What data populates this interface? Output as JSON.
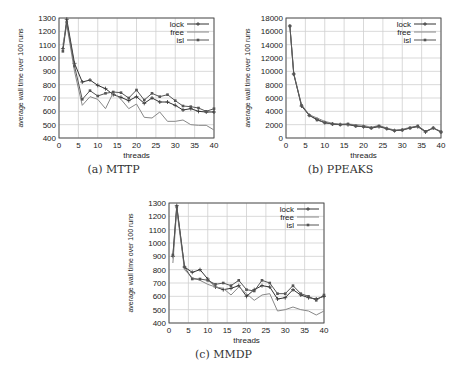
{
  "figure": {
    "captions": [
      "(a) MTTP",
      "(b) PPEAKS",
      "(c) MMDP"
    ]
  },
  "chart_data": [
    {
      "type": "line",
      "title": "(a) MTTP",
      "xlabel": "threads",
      "ylabel": "average wall time over 100 runs",
      "xlim": [
        0,
        40
      ],
      "ylim": [
        400,
        1300
      ],
      "xticks": [
        0,
        5,
        10,
        15,
        20,
        25,
        30,
        35,
        40
      ],
      "yticks": [
        400,
        500,
        600,
        700,
        800,
        900,
        1000,
        1100,
        1200,
        1300
      ],
      "grid": true,
      "legend_position": "top-right",
      "x": [
        1,
        2,
        4,
        6,
        8,
        10,
        12,
        14,
        16,
        18,
        20,
        22,
        24,
        26,
        28,
        30,
        32,
        34,
        36,
        38,
        40
      ],
      "series": [
        {
          "name": "lock",
          "marker": "plus",
          "color": "#333333",
          "values": [
            1070,
            1290,
            960,
            820,
            835,
            795,
            770,
            725,
            705,
            680,
            710,
            660,
            700,
            670,
            670,
            645,
            610,
            620,
            600,
            595,
            595
          ]
        },
        {
          "name": "free",
          "marker": "none",
          "color": "#888888",
          "values": [
            1100,
            1250,
            900,
            645,
            710,
            690,
            620,
            740,
            690,
            620,
            655,
            555,
            550,
            595,
            525,
            525,
            535,
            500,
            495,
            495,
            460
          ]
        },
        {
          "name": "isl",
          "marker": "square",
          "color": "#555555",
          "values": [
            1050,
            1270,
            940,
            690,
            755,
            715,
            735,
            745,
            740,
            700,
            760,
            685,
            735,
            710,
            725,
            680,
            640,
            635,
            625,
            600,
            620
          ]
        }
      ]
    },
    {
      "type": "line",
      "title": "(b) PPEAKS",
      "xlabel": "threads",
      "ylabel": "average wall time over 100 runs",
      "xlim": [
        0,
        40
      ],
      "ylim": [
        0,
        18000
      ],
      "xticks": [
        0,
        5,
        10,
        15,
        20,
        25,
        30,
        35,
        40
      ],
      "yticks": [
        0,
        2000,
        4000,
        6000,
        8000,
        10000,
        12000,
        14000,
        16000,
        18000
      ],
      "grid": true,
      "legend_position": "top-right",
      "x": [
        1,
        2,
        4,
        6,
        8,
        10,
        12,
        14,
        16,
        18,
        20,
        22,
        24,
        26,
        28,
        30,
        32,
        34,
        36,
        38,
        40
      ],
      "series": [
        {
          "name": "lock",
          "marker": "plus",
          "color": "#333333",
          "values": [
            16800,
            9600,
            4800,
            3400,
            2800,
            2300,
            2100,
            2000,
            2000,
            1800,
            1700,
            1500,
            1700,
            1400,
            1100,
            1200,
            1500,
            1700,
            900,
            1500,
            900
          ]
        },
        {
          "name": "free",
          "marker": "none",
          "color": "#888888",
          "values": [
            16800,
            9700,
            5000,
            3500,
            3000,
            2500,
            2200,
            2100,
            2100,
            2000,
            1900,
            1600,
            1900,
            1500,
            1200,
            1300,
            1600,
            1800,
            1000,
            1500,
            1000
          ]
        },
        {
          "name": "isl",
          "marker": "square",
          "color": "#555555",
          "values": [
            16800,
            9600,
            4900,
            3400,
            2700,
            2300,
            2100,
            2000,
            2100,
            1800,
            1700,
            1500,
            1800,
            1400,
            1100,
            1200,
            1500,
            1800,
            1000,
            1500,
            900
          ]
        }
      ]
    },
    {
      "type": "line",
      "title": "(c) MMDP",
      "xlabel": "threads",
      "ylabel": "average wall time over 100 runs",
      "xlim": [
        0,
        40
      ],
      "ylim": [
        400,
        1300
      ],
      "xticks": [
        0,
        5,
        10,
        15,
        20,
        25,
        30,
        35,
        40
      ],
      "yticks": [
        400,
        500,
        600,
        700,
        800,
        900,
        1000,
        1100,
        1200,
        1300
      ],
      "grid": true,
      "legend_position": "top-right",
      "x": [
        1,
        2,
        4,
        6,
        8,
        10,
        12,
        14,
        16,
        18,
        20,
        22,
        24,
        26,
        28,
        30,
        32,
        34,
        36,
        38,
        40
      ],
      "series": [
        {
          "name": "lock",
          "marker": "plus",
          "color": "#333333",
          "values": [
            900,
            1280,
            820,
            780,
            800,
            730,
            670,
            650,
            660,
            680,
            600,
            650,
            680,
            670,
            580,
            590,
            650,
            610,
            590,
            580,
            600
          ]
        },
        {
          "name": "free",
          "marker": "none",
          "color": "#888888",
          "values": [
            850,
            1250,
            800,
            740,
            720,
            690,
            670,
            660,
            610,
            670,
            620,
            570,
            610,
            620,
            490,
            500,
            520,
            500,
            490,
            460,
            490
          ]
        },
        {
          "name": "isl",
          "marker": "square",
          "color": "#555555",
          "values": [
            910,
            1270,
            820,
            730,
            730,
            720,
            690,
            700,
            680,
            720,
            650,
            640,
            720,
            700,
            620,
            620,
            680,
            620,
            600,
            570,
            610
          ]
        }
      ]
    }
  ]
}
